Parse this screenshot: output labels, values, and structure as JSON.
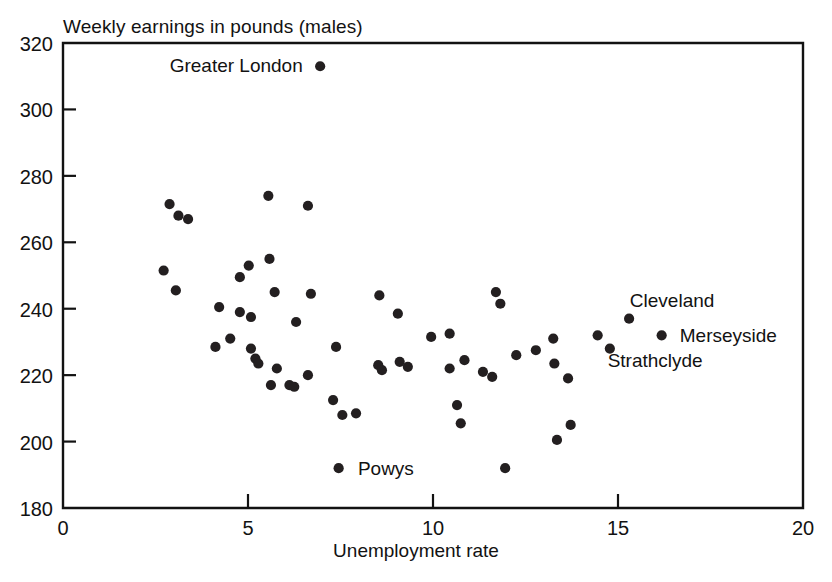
{
  "chart_data": {
    "type": "scatter",
    "title": "Weekly earnings in pounds (males)",
    "xlabel": "Unemployment rate",
    "ylabel": "Weekly earnings in pounds (males)",
    "xlim": [
      0,
      20
    ],
    "ylim": [
      180,
      320
    ],
    "xticks": [
      0,
      5,
      10,
      15,
      20
    ],
    "yticks": [
      180,
      200,
      220,
      240,
      260,
      280,
      300,
      320
    ],
    "xtick_labels": [
      "0",
      "5",
      "10",
      "15",
      "20"
    ],
    "ytick_labels": [
      "180",
      "200",
      "220",
      "240",
      "260",
      "280",
      "300",
      "320"
    ],
    "grid": false,
    "legend": false,
    "marker": "filled-circle",
    "marker_color": "#231f20",
    "points": [
      {
        "x": 6.95,
        "y": 313.0,
        "label": "Greater London"
      },
      {
        "x": 2.88,
        "y": 271.5,
        "label": ""
      },
      {
        "x": 3.12,
        "y": 268.0,
        "label": ""
      },
      {
        "x": 3.38,
        "y": 267.0,
        "label": ""
      },
      {
        "x": 5.55,
        "y": 274.0,
        "label": ""
      },
      {
        "x": 6.62,
        "y": 271.0,
        "label": ""
      },
      {
        "x": 2.72,
        "y": 251.5,
        "label": ""
      },
      {
        "x": 3.05,
        "y": 245.5,
        "label": ""
      },
      {
        "x": 4.78,
        "y": 249.5,
        "label": ""
      },
      {
        "x": 5.02,
        "y": 253.0,
        "label": ""
      },
      {
        "x": 5.58,
        "y": 255.0,
        "label": ""
      },
      {
        "x": 4.22,
        "y": 240.5,
        "label": ""
      },
      {
        "x": 4.78,
        "y": 239.0,
        "label": ""
      },
      {
        "x": 5.08,
        "y": 237.5,
        "label": ""
      },
      {
        "x": 5.72,
        "y": 245.0,
        "label": ""
      },
      {
        "x": 6.3,
        "y": 236.0,
        "label": ""
      },
      {
        "x": 6.7,
        "y": 244.5,
        "label": ""
      },
      {
        "x": 4.12,
        "y": 228.5,
        "label": ""
      },
      {
        "x": 4.52,
        "y": 231.0,
        "label": ""
      },
      {
        "x": 5.08,
        "y": 228.0,
        "label": ""
      },
      {
        "x": 5.2,
        "y": 225.0,
        "label": ""
      },
      {
        "x": 5.28,
        "y": 223.5,
        "label": ""
      },
      {
        "x": 5.78,
        "y": 222.0,
        "label": ""
      },
      {
        "x": 5.62,
        "y": 217.0,
        "label": ""
      },
      {
        "x": 6.12,
        "y": 217.0,
        "label": ""
      },
      {
        "x": 6.25,
        "y": 216.5,
        "label": ""
      },
      {
        "x": 6.62,
        "y": 220.0,
        "label": ""
      },
      {
        "x": 7.38,
        "y": 228.5,
        "label": ""
      },
      {
        "x": 7.3,
        "y": 212.5,
        "label": ""
      },
      {
        "x": 7.55,
        "y": 208.0,
        "label": ""
      },
      {
        "x": 7.92,
        "y": 208.5,
        "label": ""
      },
      {
        "x": 7.45,
        "y": 192.0,
        "label": "Powys"
      },
      {
        "x": 8.52,
        "y": 223.0,
        "label": ""
      },
      {
        "x": 8.62,
        "y": 221.5,
        "label": ""
      },
      {
        "x": 8.55,
        "y": 244.0,
        "label": ""
      },
      {
        "x": 9.05,
        "y": 238.5,
        "label": ""
      },
      {
        "x": 9.1,
        "y": 224.0,
        "label": ""
      },
      {
        "x": 9.32,
        "y": 222.5,
        "label": ""
      },
      {
        "x": 9.95,
        "y": 231.5,
        "label": ""
      },
      {
        "x": 10.45,
        "y": 232.5,
        "label": ""
      },
      {
        "x": 10.45,
        "y": 222.0,
        "label": ""
      },
      {
        "x": 10.65,
        "y": 211.0,
        "label": ""
      },
      {
        "x": 10.75,
        "y": 205.5,
        "label": ""
      },
      {
        "x": 10.85,
        "y": 224.5,
        "label": ""
      },
      {
        "x": 11.35,
        "y": 221.0,
        "label": ""
      },
      {
        "x": 11.6,
        "y": 219.5,
        "label": ""
      },
      {
        "x": 11.95,
        "y": 192.0,
        "label": ""
      },
      {
        "x": 11.82,
        "y": 241.5,
        "label": ""
      },
      {
        "x": 11.7,
        "y": 245.0,
        "label": ""
      },
      {
        "x": 12.25,
        "y": 226.0,
        "label": ""
      },
      {
        "x": 12.78,
        "y": 227.5,
        "label": ""
      },
      {
        "x": 13.25,
        "y": 231.0,
        "label": ""
      },
      {
        "x": 13.28,
        "y": 223.5,
        "label": ""
      },
      {
        "x": 13.35,
        "y": 200.5,
        "label": ""
      },
      {
        "x": 13.65,
        "y": 219.0,
        "label": ""
      },
      {
        "x": 13.72,
        "y": 205.0,
        "label": ""
      },
      {
        "x": 14.45,
        "y": 232.0,
        "label": ""
      },
      {
        "x": 15.3,
        "y": 237.0,
        "label": "Cleveland"
      },
      {
        "x": 16.18,
        "y": 232.0,
        "label": "Merseyside"
      },
      {
        "x": 14.78,
        "y": 228.0,
        "label": "Strathclyde"
      }
    ],
    "annotations": [
      {
        "text": "Greater London",
        "x": 6.75,
        "y": 313.5,
        "anchor": "end"
      },
      {
        "text": "Powys",
        "x": 7.7,
        "y": 192.0,
        "anchor": "start"
      },
      {
        "text": "Cleveland",
        "x": 15.05,
        "y": 242.5,
        "anchor": "start"
      },
      {
        "text": "Merseyside",
        "x": 16.4,
        "y": 232.0,
        "anchor": "start"
      },
      {
        "text": "Strathclyde",
        "x": 14.45,
        "y": 224.5,
        "anchor": "start"
      }
    ]
  }
}
